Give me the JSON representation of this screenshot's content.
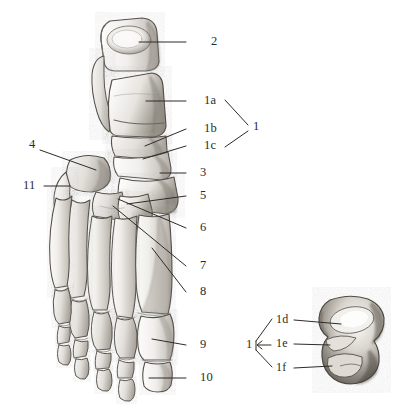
{
  "figure": {
    "type": "anatomical-illustration",
    "medium": "graphite pencil drawing",
    "background_color": "#ffffff",
    "ink_color": "#2b2b2b"
  },
  "main_view": {
    "name": "foot-skeleton-dorsal",
    "labels": [
      {
        "id": "2",
        "text": "2",
        "x": 211,
        "y": 42,
        "leader": {
          "x1": 186,
          "y1": 42,
          "x2": 139,
          "y2": 42
        }
      },
      {
        "id": "1a",
        "text": "1a",
        "x": 204,
        "y": 103,
        "leader": {
          "x1": 186,
          "y1": 101,
          "x2": 146,
          "y2": 101
        }
      },
      {
        "id": "1b",
        "text": "1b",
        "x": 204,
        "y": 131,
        "leader": {
          "x1": 186,
          "y1": 129,
          "x2": 145,
          "y2": 146
        }
      },
      {
        "id": "1c",
        "text": "1c",
        "x": 204,
        "y": 148,
        "leader": {
          "x1": 186,
          "y1": 146,
          "x2": 143,
          "y2": 159
        }
      },
      {
        "id": "3",
        "text": "3",
        "x": 200,
        "y": 175,
        "leader": {
          "x1": 186,
          "y1": 173,
          "x2": 160,
          "y2": 173
        }
      },
      {
        "id": "5",
        "text": "5",
        "x": 200,
        "y": 198,
        "leader": {
          "x1": 186,
          "y1": 196,
          "x2": 127,
          "y2": 204
        }
      },
      {
        "id": "6",
        "text": "6",
        "x": 200,
        "y": 230,
        "leader": {
          "x1": 186,
          "y1": 228,
          "x2": 118,
          "y2": 199
        }
      },
      {
        "id": "7",
        "text": "7",
        "x": 200,
        "y": 268,
        "leader": {
          "x1": 186,
          "y1": 266,
          "x2": 113,
          "y2": 206
        }
      },
      {
        "id": "8",
        "text": "8",
        "x": 200,
        "y": 294,
        "leader": {
          "x1": 186,
          "y1": 292,
          "x2": 152,
          "y2": 248
        }
      },
      {
        "id": "9",
        "text": "9",
        "x": 200,
        "y": 347,
        "leader": {
          "x1": 186,
          "y1": 345,
          "x2": 152,
          "y2": 339
        }
      },
      {
        "id": "10",
        "text": "10",
        "x": 200,
        "y": 380,
        "leader": {
          "x1": 186,
          "y1": 378,
          "x2": 149,
          "y2": 378
        }
      },
      {
        "id": "4",
        "text": "4",
        "x": 29,
        "y": 146,
        "leader": {
          "x1": 40,
          "y1": 150,
          "x2": 96,
          "y2": 170
        }
      },
      {
        "id": "11",
        "text": "11",
        "x": 23,
        "y": 187,
        "leader": {
          "x1": 44,
          "y1": 186,
          "x2": 70,
          "y2": 186
        }
      }
    ],
    "bracket_group": {
      "id": "1",
      "text": "1",
      "x": 253,
      "y": 128,
      "members": [
        "1a",
        "1b",
        "1c"
      ]
    }
  },
  "inset_view": {
    "name": "talus-inferior-view",
    "labels": [
      {
        "id": "1d",
        "text": "1d",
        "x": 276,
        "y": 322,
        "leader": {
          "x1": 294,
          "y1": 320,
          "x2": 341,
          "y2": 324
        }
      },
      {
        "id": "1e",
        "text": "1e",
        "x": 276,
        "y": 346,
        "leader": {
          "x1": 294,
          "y1": 344,
          "x2": 330,
          "y2": 345
        }
      },
      {
        "id": "1f",
        "text": "1f",
        "x": 276,
        "y": 370,
        "leader": {
          "x1": 294,
          "y1": 368,
          "x2": 332,
          "y2": 366
        }
      }
    ],
    "bracket_group": {
      "id": "1",
      "text": "1",
      "x": 246,
      "y": 346,
      "members": [
        "1d",
        "1e",
        "1f"
      ]
    }
  }
}
